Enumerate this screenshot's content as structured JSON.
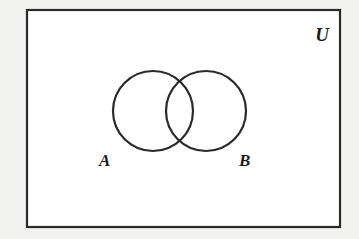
{
  "figure": {
    "type": "venn-diagram",
    "universe": {
      "label": "U",
      "label_x": 322,
      "label_y": 41,
      "rect": {
        "x": 27,
        "y": 10,
        "width": 313,
        "height": 217
      }
    },
    "sets": [
      {
        "name": "A",
        "label": "A",
        "label_x": 99,
        "label_y": 166,
        "circle": {
          "cx": 153,
          "cy": 111,
          "r": 40
        }
      },
      {
        "name": "B",
        "label": "B",
        "label_x": 239,
        "label_y": 166,
        "circle": {
          "cx": 206,
          "cy": 111,
          "r": 40
        }
      }
    ],
    "colors": {
      "page_background": "#f2f2f0",
      "universe_fill": "#ffffff",
      "stroke": "#2b2a28",
      "label": "#1d1c1b"
    }
  },
  "background_bleed": {
    "rows": [
      "              ",
      "              ",
      "                ",
      "         ",
      "        "
    ]
  }
}
